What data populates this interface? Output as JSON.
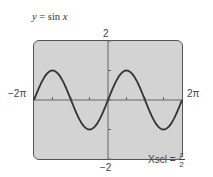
{
  "chart_data": {
    "type": "line",
    "title": "y = sin x",
    "function": "sin(x)",
    "xlabel": "",
    "ylabel": "",
    "xlim": [
      -6.2832,
      6.2832
    ],
    "ylim": [
      -2,
      2
    ],
    "x_labels": {
      "min": "−2π",
      "max": "2π"
    },
    "y_labels": {
      "min": "−2",
      "max": "2"
    },
    "xscl": "π/2",
    "yscl": 1,
    "grid": false,
    "series": [
      {
        "name": "sin x",
        "x": [
          -6.2832,
          -4.7124,
          -3.1416,
          -1.5708,
          0,
          1.5708,
          3.1416,
          4.7124,
          6.2832
        ],
        "values": [
          0,
          1,
          0,
          -1,
          0,
          1,
          0,
          -1,
          0
        ]
      }
    ]
  },
  "labels": {
    "title_prefix": "y",
    "title_eq": " = ",
    "title_fn": "sin",
    "title_var": " x",
    "ymax": "2",
    "ymin": "−2",
    "xmin": "−2π",
    "xmax": "2π",
    "xscl_label": "Xscl =",
    "xscl_num": "π",
    "xscl_den": "2"
  },
  "colors": {
    "screen_bg": "#d3d3d3",
    "curve": "#333333",
    "axis": "#666666"
  }
}
